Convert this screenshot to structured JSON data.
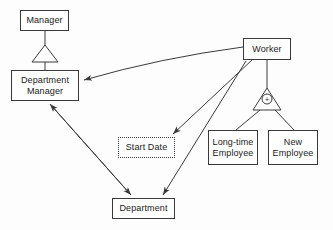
{
  "diagram": {
    "background_color": "#fdfdfd",
    "line_color": "#3a3a3a",
    "node_fill": "#ffffff",
    "text_color": "#1a1a1a",
    "nodes": [
      {
        "id": "manager",
        "label": "Manager",
        "x": 20,
        "y": 10,
        "w": 49,
        "h": 21,
        "style": "solid"
      },
      {
        "id": "department_manager",
        "label": "Department\nManager",
        "x": 11,
        "y": 70,
        "w": 68,
        "h": 31,
        "style": "solid"
      },
      {
        "id": "worker",
        "label": "Worker",
        "x": 243,
        "y": 38,
        "w": 48,
        "h": 22,
        "style": "solid"
      },
      {
        "id": "start_date",
        "label": "Start Date",
        "x": 118,
        "y": 137,
        "w": 57,
        "h": 21,
        "style": "dotted"
      },
      {
        "id": "long_time_employee",
        "label": "Long-time\nEmployee",
        "x": 208,
        "y": 130,
        "w": 50,
        "h": 35,
        "style": "solid"
      },
      {
        "id": "new_employee",
        "label": "New\nEmployee",
        "x": 268,
        "y": 130,
        "w": 50,
        "h": 35,
        "style": "solid"
      },
      {
        "id": "department",
        "label": "Department",
        "x": 112,
        "y": 198,
        "w": 63,
        "h": 21,
        "style": "solid"
      }
    ],
    "generalizations": [
      {
        "id": "manager-generalization",
        "parent": "manager",
        "child": "department_manager",
        "marker": "hollow-triangle",
        "constraint": null
      },
      {
        "id": "worker-generalization",
        "parent": "worker",
        "children": [
          "long_time_employee",
          "new_employee"
        ],
        "marker": "hollow-triangle",
        "constraint": "+"
      }
    ],
    "associations": [
      {
        "id": "worker-to-department-manager",
        "from": "worker",
        "to": "department_manager",
        "arrow": "filled"
      },
      {
        "id": "worker-to-start-date",
        "from": "worker",
        "to": "start_date",
        "arrow": "filled"
      },
      {
        "id": "worker-to-department",
        "from": "worker",
        "to": "department",
        "arrow": "filled"
      },
      {
        "id": "department-manager-to-department",
        "from": "department_manager",
        "to": "department",
        "arrow": "filled-both"
      }
    ]
  }
}
